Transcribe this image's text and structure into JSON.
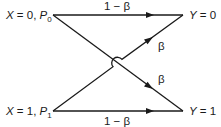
{
  "diagram": {
    "type": "binary-channel",
    "inputs": [
      {
        "id": "x0",
        "var": "X",
        "eq": " = 0, ",
        "prob": "P",
        "sub": "0"
      },
      {
        "id": "x1",
        "var": "X",
        "eq": " = 1, ",
        "prob": "P",
        "sub": "1"
      }
    ],
    "outputs": [
      {
        "id": "y0",
        "var": "Y",
        "eq": " = 0"
      },
      {
        "id": "y1",
        "var": "Y",
        "eq": " = 1"
      }
    ],
    "edges": [
      {
        "from": "x0",
        "to": "y0",
        "label": "1 − β"
      },
      {
        "from": "x0",
        "to": "y1",
        "label": "β"
      },
      {
        "from": "x1",
        "to": "y0",
        "label": "β"
      },
      {
        "from": "x1",
        "to": "y1",
        "label": "1 − β"
      }
    ],
    "colors": {
      "line": "#1a1a1a",
      "background": "#ffffff"
    }
  }
}
